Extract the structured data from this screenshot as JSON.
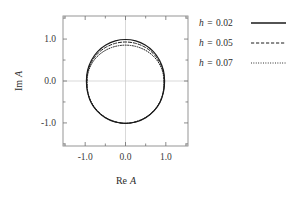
{
  "figure": {
    "background": "#ffffff",
    "frame_color": "#8a8a8a",
    "grid_color": "#c9c9c9",
    "curve_color": "#1a1a1a"
  },
  "axes": {
    "x": {
      "label": "Re A",
      "label_italic_part": "A",
      "label_roman_part": "Re",
      "ticks": [
        "-1.0",
        "0.0",
        "1.0"
      ],
      "tick_values": [
        -1.0,
        0.0,
        1.0
      ],
      "range": [
        -1.55,
        1.55
      ],
      "minor_ticks": [
        -1.5,
        -0.5,
        0.5,
        1.5
      ]
    },
    "y": {
      "label": "Im A",
      "label_italic_part": "A",
      "label_roman_part": "Im",
      "ticks": [
        "1.0",
        "0.0",
        "-1.0"
      ],
      "tick_values": [
        1.0,
        0.0,
        -1.0
      ],
      "range": [
        -1.55,
        1.55
      ],
      "minor_ticks": [
        -1.5,
        -0.5,
        0.5,
        1.5
      ]
    }
  },
  "legend": {
    "entries": [
      {
        "symbol": "h",
        "equals": "=",
        "value": "0.02",
        "label": "h = 0.02",
        "style": "solid"
      },
      {
        "symbol": "h",
        "equals": "=",
        "value": "0.05",
        "label": "h = 0.05",
        "style": "dashed"
      },
      {
        "symbol": "h",
        "equals": "=",
        "value": "0.07",
        "label": "h = 0.07",
        "style": "dotted"
      }
    ]
  },
  "chart_data": {
    "type": "line",
    "title": "",
    "xlabel": "Re A",
    "ylabel": "Im A",
    "xlim": [
      -1.55,
      1.55
    ],
    "ylim": [
      -1.55,
      1.55
    ],
    "grid": true,
    "grid_lines": {
      "x": [
        0.0
      ],
      "y": [
        0.0
      ]
    },
    "legend_position": "outside-right-top",
    "aspect": "equal",
    "series": [
      {
        "name": "h = 0.02",
        "style": "solid",
        "color": "#1a1a1a",
        "top_im": 0.99,
        "bottom_im": -1.01,
        "left_re": -0.97,
        "right_re": 0.97,
        "theta": [
          0,
          15,
          30,
          45,
          60,
          75,
          90,
          105,
          120,
          135,
          150,
          165,
          180,
          195,
          210,
          225,
          240,
          255,
          270,
          285,
          300,
          315,
          330,
          345,
          360
        ],
        "re": [
          0.97,
          0.94,
          0.845,
          0.692,
          0.489,
          0.253,
          0.0,
          -0.253,
          -0.489,
          -0.692,
          -0.845,
          -0.94,
          -0.97,
          -0.943,
          -0.858,
          -0.707,
          -0.503,
          -0.262,
          0.0,
          0.262,
          0.503,
          0.707,
          0.858,
          0.943,
          0.97
        ],
        "im": [
          0.0,
          0.256,
          0.495,
          0.7,
          0.857,
          0.956,
          0.99,
          0.956,
          0.857,
          0.7,
          0.495,
          0.256,
          0.0,
          -0.261,
          -0.505,
          -0.714,
          -0.875,
          -0.976,
          -1.01,
          -0.976,
          -0.875,
          -0.714,
          -0.505,
          -0.261,
          0.0
        ]
      },
      {
        "name": "h = 0.05",
        "style": "dashed",
        "color": "#1a1a1a",
        "top_im": 0.93,
        "bottom_im": -1.01,
        "left_re": -0.96,
        "right_re": 0.96,
        "theta": [
          0,
          15,
          30,
          45,
          60,
          75,
          90,
          105,
          120,
          135,
          150,
          165,
          180,
          195,
          210,
          225,
          240,
          255,
          270,
          285,
          300,
          315,
          330,
          345,
          360
        ],
        "re": [
          0.96,
          0.93,
          0.836,
          0.685,
          0.484,
          0.25,
          0.0,
          -0.25,
          -0.484,
          -0.685,
          -0.836,
          -0.93,
          -0.96,
          -0.938,
          -0.854,
          -0.704,
          -0.5,
          -0.261,
          0.0,
          0.261,
          0.5,
          0.704,
          0.854,
          0.938,
          0.96
        ],
        "im": [
          0.0,
          0.241,
          0.465,
          0.658,
          0.806,
          0.898,
          0.93,
          0.898,
          0.806,
          0.658,
          0.465,
          0.241,
          0.0,
          -0.26,
          -0.503,
          -0.711,
          -0.871,
          -0.971,
          -1.01,
          -0.971,
          -0.871,
          -0.711,
          -0.503,
          -0.26,
          0.0
        ]
      },
      {
        "name": "h = 0.07",
        "style": "dotted",
        "color": "#1a1a1a",
        "top_im": 0.855,
        "bottom_im": -1.01,
        "left_re": -0.95,
        "right_re": 0.95,
        "theta": [
          0,
          15,
          30,
          45,
          60,
          75,
          90,
          105,
          120,
          135,
          150,
          165,
          180,
          195,
          210,
          225,
          240,
          255,
          270,
          285,
          300,
          315,
          330,
          345,
          360
        ],
        "re": [
          0.95,
          0.921,
          0.828,
          0.678,
          0.479,
          0.248,
          0.0,
          -0.248,
          -0.479,
          -0.678,
          -0.828,
          -0.921,
          -0.95,
          -0.933,
          -0.85,
          -0.7,
          -0.498,
          -0.26,
          0.0,
          0.26,
          0.498,
          0.7,
          0.85,
          0.933,
          0.95
        ],
        "im": [
          0.0,
          0.221,
          0.428,
          0.605,
          0.741,
          0.826,
          0.855,
          0.826,
          0.741,
          0.605,
          0.428,
          0.221,
          0.0,
          -0.258,
          -0.5,
          -0.707,
          -0.867,
          -0.967,
          -1.01,
          -0.967,
          -0.867,
          -0.707,
          -0.5,
          -0.258,
          0.0
        ]
      }
    ]
  }
}
